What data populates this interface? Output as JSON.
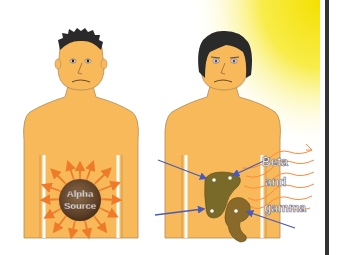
{
  "figures": {
    "left": {
      "label": "Alpha Source",
      "label_line1": "Alpha",
      "label_line2": "Source",
      "description": "Man with internal alpha radiation source in abdomen, arrows radiating outward"
    },
    "right": {
      "label_line1": "Beta",
      "label_line2": "and",
      "label_line3": "gamma",
      "description": "Man exposed to external beta and gamma radiation; arrows point to internal organs"
    }
  },
  "colors": {
    "skin": "#f8b95a",
    "skin_outline": "#b08a5a",
    "hair": "#2a2a2a",
    "alpha_sphere": "#6b4a2e",
    "arrow_orange": "#ee7a2a",
    "arrow_blue": "#5566bb",
    "organ": "#7a6a2a",
    "radiation_wave": "#ff8a3a",
    "glow_yellow": "#f7e520",
    "divider": "#333333"
  }
}
